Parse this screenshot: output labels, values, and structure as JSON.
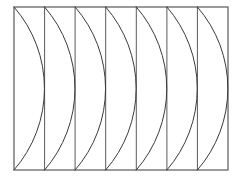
{
  "figure": {
    "background_color": "#ffffff",
    "stroke_color": "#3a3a3a",
    "frame_stroke_color": "#595959",
    "stroke_width": 1,
    "frame_stroke_width": 1.2,
    "canvas": {
      "width": 237,
      "height": 177
    },
    "frame": {
      "x": 14,
      "y": 7,
      "width": 214,
      "height": 163,
      "right": 228,
      "bottom": 170
    },
    "columns": {
      "count": 7,
      "width": 30.57,
      "boundary_x": [
        14,
        44.6,
        75.1,
        105.7,
        136.3,
        166.9,
        197.4,
        228
      ]
    },
    "arcs": {
      "count": 7,
      "shape": "circular-arc",
      "bulge_direction": "right",
      "bulge_width": 30.6,
      "sweep_flag": 1,
      "radius": 118,
      "start_x": [
        14,
        44.6,
        75.1,
        105.7,
        136.3,
        166.9,
        197.4
      ],
      "apex_x": [
        44.6,
        75.1,
        105.7,
        136.3,
        166.9,
        197.4,
        228
      ],
      "top_y": 7,
      "bottom_y": 170,
      "apex_y": 88.5
    },
    "vertical_lines": {
      "count": 6,
      "x": [
        44.6,
        75.1,
        105.7,
        136.3,
        166.9,
        197.4
      ],
      "top_y": 7,
      "bottom_y": 170
    }
  }
}
